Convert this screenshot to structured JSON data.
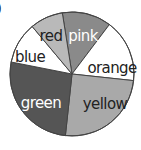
{
  "corner_mark": ")",
  "chart_data": {
    "type": "pie",
    "title": "",
    "categories": [
      "pink",
      "orange",
      "yellow",
      "green",
      "blue",
      "red"
    ],
    "values": [
      12.8,
      16.4,
      25.0,
      26.4,
      10.8,
      8.6
    ],
    "unit": "percent (estimated from slice angles)",
    "start_angle_deg": 351,
    "direction": "clockwise",
    "legend": "none (labels drawn inside slices)",
    "slices": [
      {
        "label": "pink",
        "value": 12.8,
        "fill": "#8a8a8a",
        "text_color": "#ffffff"
      },
      {
        "label": "orange",
        "value": 16.4,
        "fill": "#ffffff",
        "text_color": "#222222"
      },
      {
        "label": "yellow",
        "value": 25.0,
        "fill": "#a9a9a9",
        "text_color": "#222222"
      },
      {
        "label": "green",
        "value": 26.4,
        "fill": "#555555",
        "text_color": "#ffffff"
      },
      {
        "label": "blue",
        "value": 10.8,
        "fill": "#ffffff",
        "text_color": "#222222"
      },
      {
        "label": "red",
        "value": 8.6,
        "fill": "#b9b9b9",
        "text_color": "#222222"
      }
    ]
  },
  "pie": {
    "cx": 72,
    "cy": 74,
    "r": 62,
    "stroke": "#444444",
    "label_positions": [
      {
        "x": 83,
        "y": 36
      },
      {
        "x": 112,
        "y": 68
      },
      {
        "x": 105,
        "y": 104
      },
      {
        "x": 41,
        "y": 103
      },
      {
        "x": 30,
        "y": 57
      },
      {
        "x": 51,
        "y": 36
      }
    ]
  }
}
